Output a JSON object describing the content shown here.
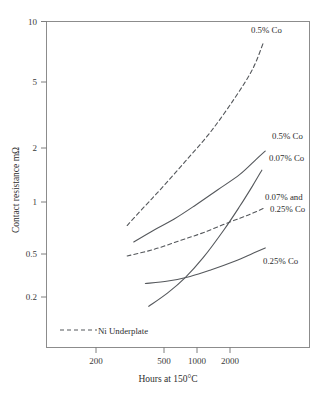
{
  "chart_data": {
    "type": "line",
    "title": "",
    "xlabel": "Hours at 150°C",
    "ylabel": "Contact resistance mΩ",
    "xscale": "log",
    "yscale": "log",
    "xlim": [
      100,
      4000
    ],
    "ylim": [
      0.13,
      10
    ],
    "grid": false,
    "xticks": [
      200,
      500,
      1000,
      2000
    ],
    "xticklabels": [
      "200",
      "500",
      "1000",
      "2000"
    ],
    "yticks": [
      0.2,
      0.5,
      1,
      2,
      5,
      10
    ],
    "yticklabels": [
      "0.2",
      "0.5",
      "1",
      "2",
      "5",
      "10"
    ],
    "legend": {
      "position": "inside-bottom-left",
      "entries": [
        {
          "label": "Ni Underplate",
          "style": "dashed"
        }
      ]
    },
    "series": [
      {
        "name": "0.5% Co (Ni underplate)",
        "style": "dashed",
        "label": "0.5% Co",
        "label_lines": [
          "0.5% Co"
        ],
        "points": [
          [
            310,
            0.66
          ],
          [
            400,
            0.86
          ],
          [
            500,
            1.08
          ],
          [
            700,
            1.55
          ],
          [
            1000,
            2.3
          ],
          [
            1400,
            3.6
          ],
          [
            1800,
            5.3
          ],
          [
            2100,
            7.6
          ]
        ]
      },
      {
        "name": "0.5% Co",
        "style": "solid",
        "label": "0.5% Co",
        "label_lines": [
          "0.5% Co"
        ],
        "points": [
          [
            340,
            0.53
          ],
          [
            450,
            0.62
          ],
          [
            600,
            0.72
          ],
          [
            800,
            0.86
          ],
          [
            1100,
            1.06
          ],
          [
            1500,
            1.3
          ],
          [
            1900,
            1.6
          ],
          [
            2150,
            1.78
          ]
        ]
      },
      {
        "name": "0.07% Co",
        "style": "solid",
        "label": "0.07% Co",
        "label_lines": [
          "0.07% Co"
        ],
        "points": [
          [
            420,
            0.225
          ],
          [
            550,
            0.27
          ],
          [
            700,
            0.33
          ],
          [
            900,
            0.43
          ],
          [
            1200,
            0.62
          ],
          [
            1500,
            0.85
          ],
          [
            1800,
            1.12
          ],
          [
            2050,
            1.38
          ]
        ]
      },
      {
        "name": "0.07% and 0.25% Co (Ni underplate)",
        "style": "dashed",
        "label": "0.07% and 0.25% Co",
        "label_lines": [
          "0.07% and",
          "0.25% Co"
        ],
        "points": [
          [
            310,
            0.44
          ],
          [
            450,
            0.48
          ],
          [
            650,
            0.54
          ],
          [
            900,
            0.6
          ],
          [
            1300,
            0.69
          ],
          [
            1700,
            0.76
          ],
          [
            2100,
            0.83
          ]
        ]
      },
      {
        "name": "0.25% Co",
        "style": "solid",
        "label": "0.25% Co",
        "label_lines": [
          "0.25% Co"
        ],
        "points": [
          [
            400,
            0.305
          ],
          [
            550,
            0.315
          ],
          [
            750,
            0.335
          ],
          [
            1000,
            0.365
          ],
          [
            1400,
            0.41
          ],
          [
            1800,
            0.455
          ],
          [
            2150,
            0.49
          ]
        ]
      }
    ]
  },
  "axes": {
    "ylabel": "Contact resistance mΩ",
    "xlabel": "Hours at 150°C",
    "xticklabels": [
      "200",
      "500",
      "1000",
      "2000"
    ],
    "yticklabels": [
      "0.2",
      "0.5",
      "1",
      "2",
      "5",
      "10"
    ]
  },
  "annotations": {
    "top_dashed": "0.5% Co",
    "solid_upper": "0.5% Co",
    "solid_steep": "0.07% Co",
    "mid_dashed_line1": "0.07% and",
    "mid_dashed_line2": "0.25% Co",
    "solid_lower": "0.25% Co"
  },
  "legend": {
    "ni_underplate": "Ni Underplate"
  }
}
